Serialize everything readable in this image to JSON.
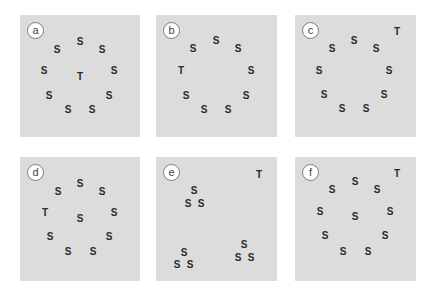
{
  "figure": {
    "panels": [
      {
        "label": "a",
        "box": {
          "x": 20,
          "y": 15,
          "w": 120,
          "h": 122
        },
        "badge": {
          "x": 27,
          "y": 22
        },
        "items": [
          {
            "char": "S",
            "x": 80,
            "y": 42
          },
          {
            "char": "S",
            "x": 57,
            "y": 50
          },
          {
            "char": "S",
            "x": 102,
            "y": 50
          },
          {
            "char": "S",
            "x": 44,
            "y": 71
          },
          {
            "char": "T",
            "x": 80,
            "y": 77
          },
          {
            "char": "S",
            "x": 114,
            "y": 71
          },
          {
            "char": "S",
            "x": 49,
            "y": 96
          },
          {
            "char": "S",
            "x": 109,
            "y": 96
          },
          {
            "char": "S",
            "x": 68,
            "y": 110
          },
          {
            "char": "S",
            "x": 92,
            "y": 110
          }
        ]
      },
      {
        "label": "b",
        "box": {
          "x": 156,
          "y": 15,
          "w": 121,
          "h": 122
        },
        "badge": {
          "x": 163,
          "y": 22
        },
        "items": [
          {
            "char": "S",
            "x": 216,
            "y": 41
          },
          {
            "char": "S",
            "x": 193,
            "y": 49
          },
          {
            "char": "S",
            "x": 238,
            "y": 49
          },
          {
            "char": "T",
            "x": 181,
            "y": 71
          },
          {
            "char": "S",
            "x": 251,
            "y": 71
          },
          {
            "char": "S",
            "x": 186,
            "y": 96
          },
          {
            "char": "S",
            "x": 246,
            "y": 96
          },
          {
            "char": "S",
            "x": 204,
            "y": 110
          },
          {
            "char": "S",
            "x": 228,
            "y": 110
          }
        ]
      },
      {
        "label": "c",
        "box": {
          "x": 295,
          "y": 15,
          "w": 121,
          "h": 122
        },
        "badge": {
          "x": 302,
          "y": 22
        },
        "items": [
          {
            "char": "T",
            "x": 397,
            "y": 32
          },
          {
            "char": "S",
            "x": 354,
            "y": 41
          },
          {
            "char": "S",
            "x": 332,
            "y": 49
          },
          {
            "char": "S",
            "x": 376,
            "y": 49
          },
          {
            "char": "S",
            "x": 319,
            "y": 71
          },
          {
            "char": "S",
            "x": 389,
            "y": 71
          },
          {
            "char": "S",
            "x": 324,
            "y": 95
          },
          {
            "char": "S",
            "x": 384,
            "y": 95
          },
          {
            "char": "S",
            "x": 342,
            "y": 109
          },
          {
            "char": "S",
            "x": 366,
            "y": 109
          }
        ]
      },
      {
        "label": "d",
        "box": {
          "x": 20,
          "y": 157,
          "w": 120,
          "h": 124
        },
        "badge": {
          "x": 27,
          "y": 164
        },
        "items": [
          {
            "char": "S",
            "x": 80,
            "y": 184
          },
          {
            "char": "S",
            "x": 58,
            "y": 192
          },
          {
            "char": "S",
            "x": 102,
            "y": 192
          },
          {
            "char": "T",
            "x": 45,
            "y": 213
          },
          {
            "char": "S",
            "x": 80,
            "y": 219
          },
          {
            "char": "S",
            "x": 114,
            "y": 213
          },
          {
            "char": "S",
            "x": 50,
            "y": 237
          },
          {
            "char": "S",
            "x": 109,
            "y": 237
          },
          {
            "char": "S",
            "x": 68,
            "y": 252
          },
          {
            "char": "S",
            "x": 93,
            "y": 252
          }
        ]
      },
      {
        "label": "e",
        "box": {
          "x": 156,
          "y": 157,
          "w": 121,
          "h": 124
        },
        "badge": {
          "x": 163,
          "y": 164
        },
        "items": [
          {
            "char": "T",
            "x": 259,
            "y": 175
          },
          {
            "char": "S",
            "x": 194,
            "y": 191
          },
          {
            "char": "S",
            "x": 188,
            "y": 204
          },
          {
            "char": "S",
            "x": 201,
            "y": 204
          },
          {
            "char": "S",
            "x": 244,
            "y": 245
          },
          {
            "char": "S",
            "x": 238,
            "y": 258
          },
          {
            "char": "S",
            "x": 251,
            "y": 258
          },
          {
            "char": "S",
            "x": 184,
            "y": 253
          },
          {
            "char": "S",
            "x": 177,
            "y": 265
          },
          {
            "char": "S",
            "x": 190,
            "y": 265
          }
        ]
      },
      {
        "label": "f",
        "box": {
          "x": 295,
          "y": 157,
          "w": 121,
          "h": 124
        },
        "badge": {
          "x": 302,
          "y": 164
        },
        "items": [
          {
            "char": "T",
            "x": 397,
            "y": 174
          },
          {
            "char": "S",
            "x": 355,
            "y": 182
          },
          {
            "char": "S",
            "x": 332,
            "y": 190
          },
          {
            "char": "S",
            "x": 377,
            "y": 190
          },
          {
            "char": "S",
            "x": 320,
            "y": 212
          },
          {
            "char": "S",
            "x": 390,
            "y": 212
          },
          {
            "char": "S",
            "x": 355,
            "y": 217
          },
          {
            "char": "S",
            "x": 325,
            "y": 236
          },
          {
            "char": "S",
            "x": 385,
            "y": 236
          },
          {
            "char": "S",
            "x": 343,
            "y": 252
          },
          {
            "char": "S",
            "x": 368,
            "y": 252
          }
        ]
      }
    ]
  },
  "colors": {
    "panel_bg": "#dcdcdc",
    "letter": "#2a2a2a",
    "badge_bg": "#ffffff",
    "badge_border": "#7a7a7a"
  }
}
